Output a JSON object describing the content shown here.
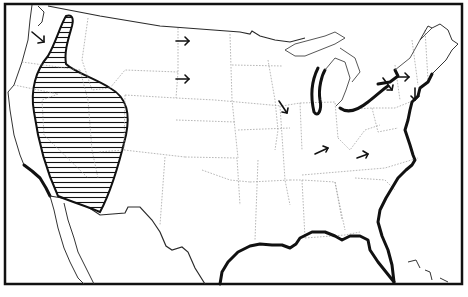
{
  "map": {
    "subject": "Contiguous United States outline map",
    "style": "black-and-white line map",
    "colors": {
      "background": "#ffffff",
      "ink": "#111111",
      "state_lines": "#9a9a9a"
    },
    "legend": {
      "hatched_region": "Hatched region over western interior (Great Basin area)",
      "bold_coastlines": "Bold lines along Gulf Coast, Atlantic Coast, southern California coast, and Great Lakes shores",
      "arrows": "Directional arrows"
    },
    "arrows": [
      {
        "id": "pacific-northwest",
        "x": 40,
        "y": 40,
        "direction": "southeast"
      },
      {
        "id": "montana-north",
        "x": 183,
        "y": 41,
        "direction": "east"
      },
      {
        "id": "montana-south",
        "x": 183,
        "y": 79,
        "direction": "east"
      },
      {
        "id": "wisconsin-illinois",
        "x": 283,
        "y": 105,
        "direction": "southeast"
      },
      {
        "id": "kentucky",
        "x": 320,
        "y": 150,
        "direction": "east-northeast"
      },
      {
        "id": "virginia",
        "x": 362,
        "y": 155,
        "direction": "east-northeast"
      },
      {
        "id": "new-york-west",
        "x": 388,
        "y": 83,
        "direction": "southeast"
      },
      {
        "id": "new-york-east",
        "x": 405,
        "y": 77,
        "direction": "east"
      },
      {
        "id": "new-england",
        "x": 415,
        "y": 95,
        "direction": "south"
      }
    ]
  }
}
